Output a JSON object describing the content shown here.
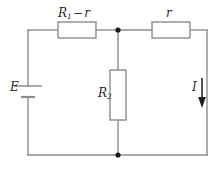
{
  "figure": {
    "type": "electrical-circuit-diagram",
    "title": "",
    "background_color": "#ffffff",
    "wire_color": "#8c8c8c",
    "component_outline_color": "#8c8c8c",
    "label_color": "#2b2b2b",
    "junction_color": "#1a1a1a"
  },
  "labels": {
    "source": "E",
    "resistor_top_left_main": "R",
    "resistor_top_left_sub": "1",
    "resistor_top_left_operator": "−",
    "resistor_top_left_operand": "r",
    "resistor_top_right": "r",
    "resistor_middle_main": "R",
    "resistor_middle_sub": "2",
    "current": "I"
  },
  "components": [
    {
      "name": "voltage-source",
      "symbol": "battery",
      "label": "E",
      "orientation": "vertical",
      "position": "left-branch"
    },
    {
      "name": "resistor-top-left",
      "symbol": "resistor-box",
      "label": "R1 − r",
      "orientation": "horizontal",
      "position": "top-left-branch"
    },
    {
      "name": "resistor-top-right",
      "symbol": "resistor-box",
      "label": "r",
      "orientation": "horizontal",
      "position": "top-right-branch"
    },
    {
      "name": "resistor-middle",
      "symbol": "resistor-box",
      "label": "R2",
      "orientation": "vertical",
      "position": "middle-branch"
    },
    {
      "name": "current-arrow",
      "symbol": "arrow-down",
      "label": "I",
      "orientation": "vertical-down",
      "position": "right-branch"
    }
  ],
  "junctions": [
    {
      "name": "junction-top-middle"
    },
    {
      "name": "junction-bottom-middle"
    }
  ]
}
